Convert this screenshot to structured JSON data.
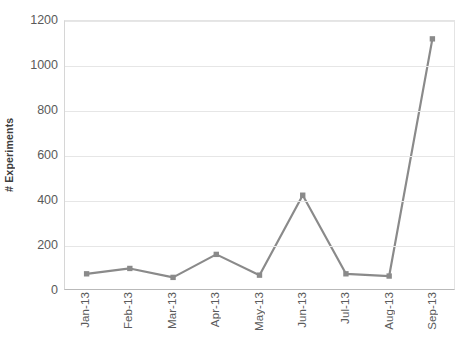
{
  "chart_data": {
    "type": "line",
    "title": "",
    "xlabel": "",
    "ylabel": "# Experiments",
    "categories": [
      "Jan-13",
      "Feb-13",
      "Mar-13",
      "Apr-13",
      "May-13",
      "Jun-13",
      "Jul-13",
      "Aug-13",
      "Sep-13"
    ],
    "values": [
      68,
      92,
      52,
      155,
      62,
      420,
      68,
      58,
      1120
    ],
    "series": [
      {
        "name": "# Experiments",
        "values": [
          68,
          92,
          52,
          155,
          62,
          420,
          68,
          58,
          1120
        ]
      }
    ],
    "ylim": [
      0,
      1200
    ],
    "y_ticks": [
      0,
      200,
      400,
      600,
      800,
      1000,
      1200
    ],
    "y_tick_labels": [
      "0",
      "200",
      "400",
      "600",
      "800",
      "1000",
      "1200"
    ],
    "grid": true,
    "legend": "none",
    "marker": "square",
    "line_color": "#8a8a8a",
    "marker_color": "#8a8a8a",
    "grid_color": "#e6e6e6",
    "axis_color": "#b9b9b9",
    "text_color": "#5a5a5a"
  }
}
